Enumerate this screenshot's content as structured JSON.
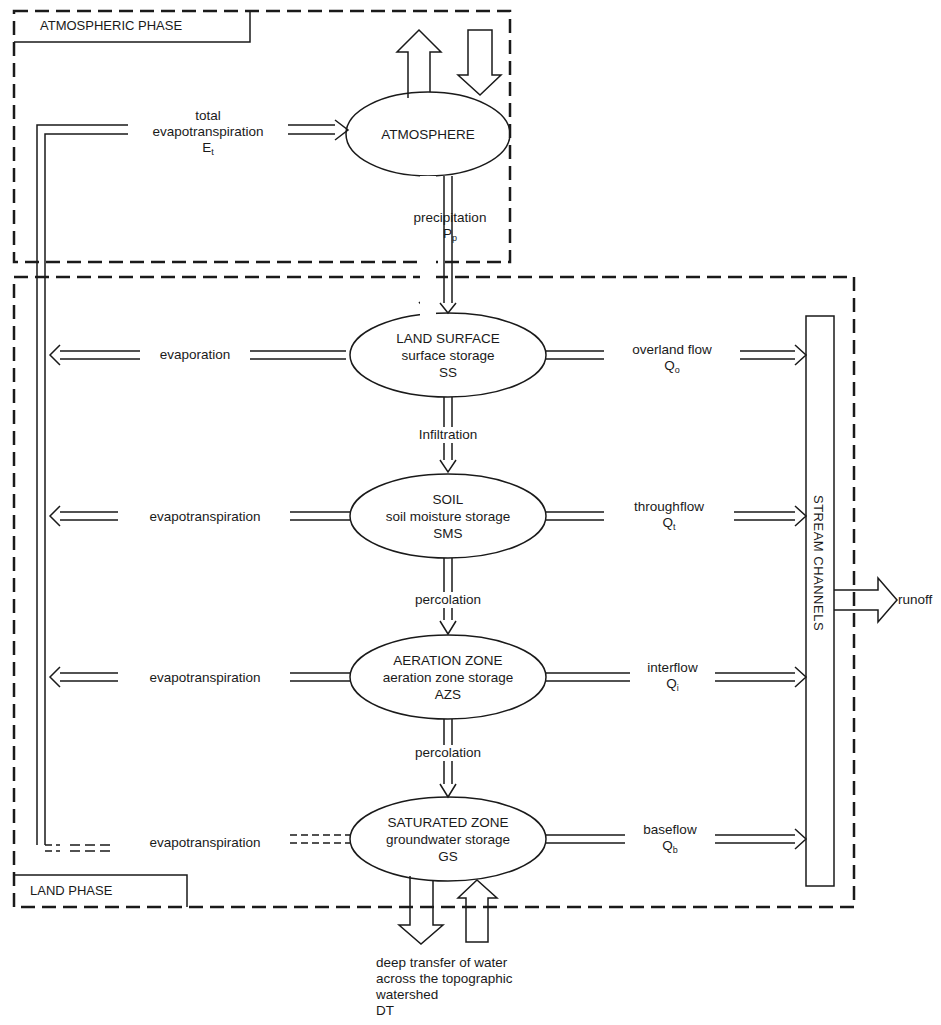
{
  "phases": {
    "atmospheric": "ATMOSPHERIC PHASE",
    "land": "LAND PHASE"
  },
  "nodes": {
    "atmosphere": {
      "title": "ATMOSPHERE"
    },
    "land_surface": {
      "title": "LAND SURFACE",
      "storage": "surface storage",
      "abbr": "SS"
    },
    "soil": {
      "title": "SOIL",
      "storage": "soil moisture storage",
      "abbr": "SMS"
    },
    "aeration_zone": {
      "title": "AERATION ZONE",
      "storage": "aeration zone storage",
      "abbr": "AZS"
    },
    "saturated_zone": {
      "title": "SATURATED ZONE",
      "storage": "groundwater storage",
      "abbr": "GS"
    },
    "stream_channels": {
      "title": "STREAM CHANNELS"
    }
  },
  "flows": {
    "total_et": {
      "line1": "total",
      "line2": "evapotranspiration",
      "sym": "E",
      "sub": "t"
    },
    "precipitation": {
      "label": "precipitation",
      "sym": "P",
      "sub": "p"
    },
    "infiltration": {
      "label": "Infiltration"
    },
    "percolation_1": {
      "label": "percolation"
    },
    "percolation_2": {
      "label": "percolation"
    },
    "evaporation": {
      "label": "evaporation"
    },
    "et_soil": {
      "label": "evapotranspiration"
    },
    "et_aeration": {
      "label": "evapotranspiration"
    },
    "et_saturated": {
      "label": "evapotranspiration"
    },
    "overland": {
      "label": "overland flow",
      "sym": "Q",
      "sub": "o"
    },
    "throughflow": {
      "label": "throughflow",
      "sym": "Q",
      "sub": "t"
    },
    "interflow": {
      "label": "interflow",
      "sym": "Q",
      "sub": "i"
    },
    "baseflow": {
      "label": "baseflow",
      "sym": "Q",
      "sub": "b"
    },
    "runoff": {
      "label": "runoff"
    },
    "deep_transfer": {
      "line1": "deep transfer of water",
      "line2": "across the topographic",
      "line3": "watershed",
      "line4": "DT"
    }
  },
  "colors": {
    "ink": "#1a1a1a",
    "background": "#ffffff"
  }
}
